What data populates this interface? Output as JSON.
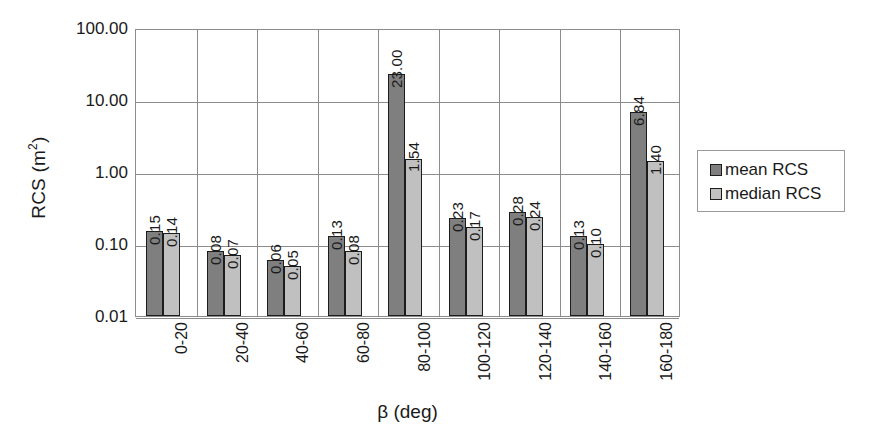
{
  "chart_data": {
    "type": "bar",
    "title": "",
    "subtitle": "",
    "xlabel": "β (deg)",
    "ylabel": "RCS (m2)",
    "ylabel_base": "RCS (m",
    "ylabel_sup": "2",
    "ylabel_close": ")",
    "yscale": "log",
    "ylim": [
      0.01,
      100
    ],
    "yticks": [
      "100.00",
      "10.00",
      "1.00",
      "0.10",
      "0.01"
    ],
    "ytick_values": [
      100,
      10,
      1,
      0.1,
      0.01
    ],
    "grid": "horizontal-and-category-separators",
    "legend_position": "right-outside",
    "categories": [
      "0-20",
      "20-40",
      "40-60",
      "60-80",
      "80-100",
      "100-120",
      "120-140",
      "140-160",
      "160-180"
    ],
    "series": [
      {
        "name": "mean RCS",
        "color": "#7f7f7f",
        "values": [
          0.15,
          0.08,
          0.06,
          0.13,
          23.0,
          0.23,
          0.28,
          0.13,
          6.84
        ],
        "labels": [
          "0.15",
          "0.08",
          "0.06",
          "0.13",
          "23.00",
          "0.23",
          "0.28",
          "0.13",
          "6.84"
        ]
      },
      {
        "name": "median RCS",
        "color": "#c0c0c0",
        "values": [
          0.14,
          0.07,
          0.05,
          0.08,
          1.54,
          0.17,
          0.24,
          0.1,
          1.4
        ],
        "labels": [
          "0.14",
          "0.07",
          "0.05",
          "0.08",
          "1.54",
          "0.17",
          "0.24",
          "0.10",
          "1.40"
        ]
      }
    ]
  },
  "legend": {
    "items": [
      {
        "label": "mean RCS",
        "color": "#7f7f7f"
      },
      {
        "label": "median RCS",
        "color": "#c0c0c0"
      }
    ]
  }
}
